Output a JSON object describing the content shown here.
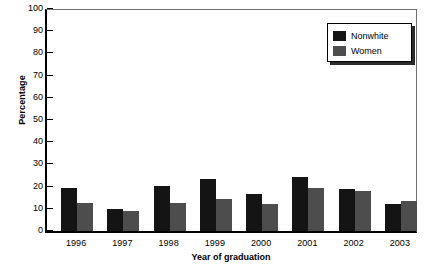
{
  "chart_data": {
    "type": "bar",
    "title": "",
    "xlabel": "Year of graduation",
    "ylabel": "Percentage",
    "categories": [
      "1996",
      "1997",
      "1998",
      "1999",
      "2000",
      "2001",
      "2002",
      "2003"
    ],
    "series": [
      {
        "name": "Nonwhite",
        "color": "#141414",
        "values": [
          19.5,
          10.0,
          20.2,
          23.5,
          16.7,
          24.5,
          18.9,
          12.0
        ]
      },
      {
        "name": "Women",
        "color": "#4d4d4d",
        "values": [
          12.8,
          8.8,
          12.5,
          14.3,
          12.3,
          19.5,
          17.8,
          13.5
        ]
      }
    ],
    "ylim": [
      0,
      100
    ],
    "yticks": [
      "0",
      "10",
      "20",
      "30",
      "40",
      "50",
      "60",
      "70",
      "80",
      "90",
      "100"
    ],
    "grid": false,
    "legend_position": "top-right"
  },
  "legend": {
    "items": [
      {
        "label": "Nonwhite"
      },
      {
        "label": "Women"
      }
    ]
  }
}
